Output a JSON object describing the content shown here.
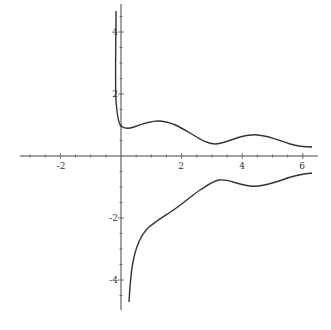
{
  "chart_data": {
    "type": "line",
    "title": "",
    "xlabel": "",
    "ylabel": "",
    "xlim": [
      -3.2,
      6.4
    ],
    "ylim": [
      -5.0,
      5.0
    ],
    "grid": false,
    "legend": null,
    "x_ticks": [
      -2,
      2,
      4,
      6
    ],
    "y_ticks": [
      -4,
      -2,
      2,
      4
    ],
    "x_tick_labels": [
      "-2",
      "2",
      "4",
      "6"
    ],
    "y_tick_labels": [
      "-4",
      "-2",
      "2",
      "4"
    ],
    "series": [
      {
        "name": "upper branch",
        "x": [
          -0.17,
          -0.17,
          -0.16,
          -0.15,
          -0.12,
          -0.08,
          0.0,
          0.2,
          0.6,
          1.0,
          1.2,
          1.6,
          2.0,
          2.5,
          3.0,
          3.2,
          3.5,
          4.0,
          4.5,
          4.6,
          5.0,
          5.5,
          6.0,
          6.3
        ],
        "y": [
          4.6,
          3.5,
          2.5,
          1.8,
          1.3,
          1.05,
          0.95,
          0.9,
          1.05,
          1.15,
          1.15,
          1.0,
          0.8,
          0.55,
          0.4,
          0.38,
          0.42,
          0.55,
          0.65,
          0.65,
          0.6,
          0.45,
          0.3,
          0.28
        ]
      },
      {
        "name": "lower branch",
        "x": [
          0.27,
          0.3,
          0.4,
          0.55,
          0.8,
          1.1,
          1.5,
          2.0,
          2.5,
          3.0,
          3.2,
          3.5,
          4.0,
          4.5,
          5.0,
          5.5,
          6.0,
          6.3
        ],
        "y": [
          -4.7,
          -4.2,
          -3.4,
          -2.7,
          -2.3,
          -2.0,
          -1.7,
          -1.45,
          -1.1,
          -0.8,
          -0.78,
          -0.82,
          -0.95,
          -1.0,
          -0.95,
          -0.8,
          -0.62,
          -0.55
        ]
      }
    ]
  }
}
